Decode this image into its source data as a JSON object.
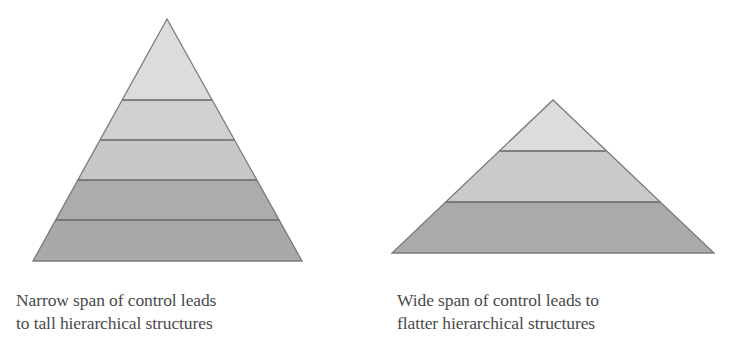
{
  "figure": {
    "left_pyramid": {
      "label": "Tall hierarchy",
      "levels": 5,
      "apex": [
        167,
        19
      ],
      "base_y": 261,
      "base_left": 33,
      "base_right": 302,
      "dividers_y": [
        100,
        140,
        180,
        220
      ],
      "band_colors": [
        "#dcdcdc",
        "#d0d0d0",
        "#c8c8c8",
        "#acacac",
        "#a9a9a9"
      ],
      "outline_color": "#7a7a7a",
      "caption": {
        "line1": "Narrow span of control leads",
        "line2": "to tall hierarchical structures"
      }
    },
    "right_pyramid": {
      "label": "Flat hierarchy",
      "levels": 3,
      "apex": [
        553,
        100
      ],
      "base_y": 253,
      "base_left": 392,
      "base_right": 714,
      "dividers_y": [
        151,
        202
      ],
      "band_colors": [
        "#dcdcdc",
        "#cacaca",
        "#aaaaaa"
      ],
      "outline_color": "#7a7a7a",
      "caption": {
        "line1": "Wide span of control leads to",
        "line2": "flatter hierarchical structures"
      }
    }
  }
}
